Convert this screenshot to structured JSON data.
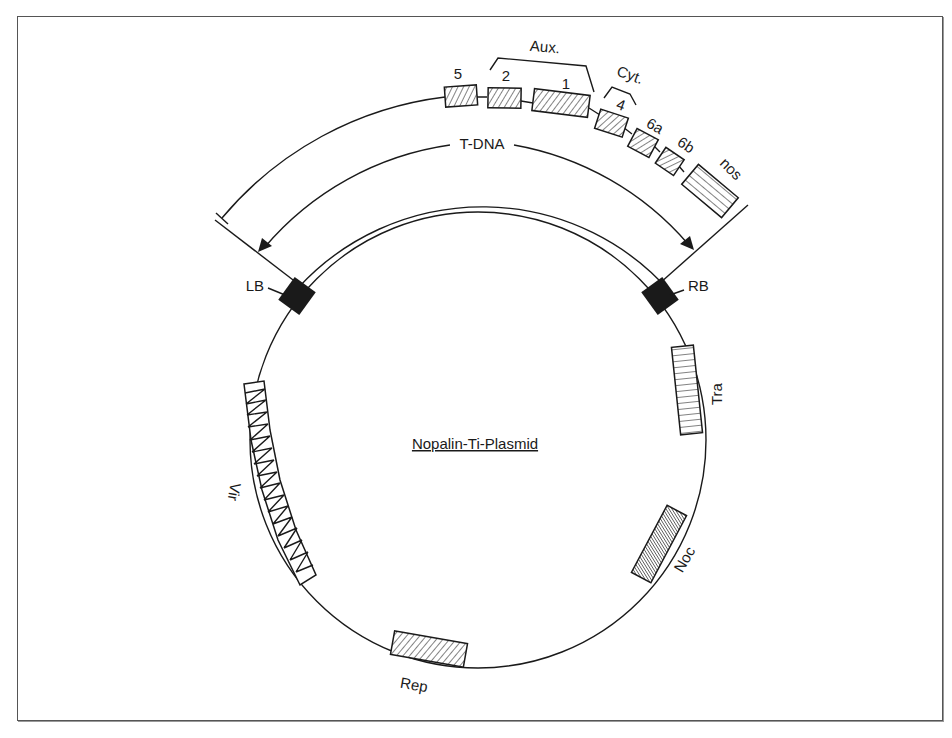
{
  "diagram": {
    "title": "Nopalin-Ti-Plasmid",
    "tdna_label": "T-DNA",
    "borders": {
      "left": "LB",
      "right": "RB"
    },
    "tdna_genes": [
      {
        "label": "5"
      },
      {
        "label": "2"
      },
      {
        "label": "1"
      },
      {
        "label": "4"
      },
      {
        "label": "6a"
      },
      {
        "label": "6b"
      },
      {
        "label": "nos"
      }
    ],
    "gene_groups": [
      {
        "label": "Aux.",
        "members": [
          "2",
          "1"
        ]
      },
      {
        "label": "Cyt.",
        "members": [
          "4"
        ]
      }
    ],
    "plasmid_regions": [
      {
        "label": "Tra"
      },
      {
        "label": "Noc"
      },
      {
        "label": "Rep"
      },
      {
        "label": "Vir"
      }
    ],
    "colors": {
      "ink": "#1a1a1a",
      "background": "#ffffff",
      "frame": "#555555"
    }
  }
}
